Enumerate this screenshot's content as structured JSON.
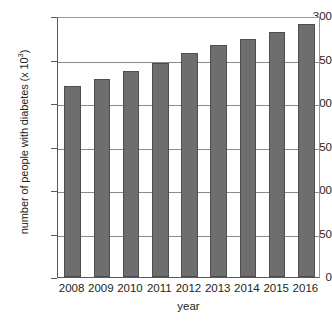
{
  "chart_data": {
    "type": "bar",
    "title": "",
    "xlabel": "year",
    "ylabel": "number of people with diabetes (x 10³)",
    "ylabel_base": "number of people with diabetes (x 10",
    "ylabel_exponent": "3",
    "ylabel_suffix": ")",
    "categories": [
      "2008",
      "2009",
      "2010",
      "2011",
      "2012",
      "2013",
      "2014",
      "2015",
      "2016"
    ],
    "values": [
      220,
      228,
      237,
      246,
      258,
      267,
      274,
      282,
      291
    ],
    "ylim": [
      0,
      300
    ],
    "xlim_note": "categorical",
    "yticks": [
      0,
      50,
      100,
      150,
      200,
      250,
      300
    ],
    "ytick_labels": [
      "0",
      "50",
      "100",
      "150",
      "200",
      "250",
      "300"
    ],
    "grid": "horizontal",
    "legend": "none",
    "bar_color": "#6e6e6e",
    "bar_edge_color": "#4e4e4e",
    "axis_color": "#58595b",
    "grid_color": "#8a8a8c",
    "background": "#ffffff"
  }
}
